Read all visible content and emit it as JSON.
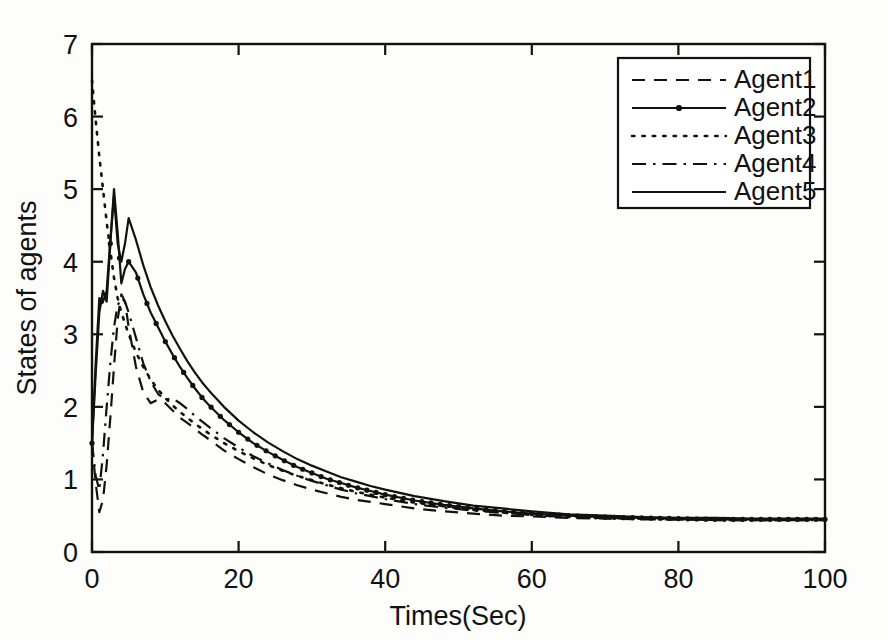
{
  "figure": {
    "background_color": "#fdfdfb",
    "ink_color": "#111111"
  },
  "chart_data": {
    "type": "line",
    "title": "",
    "xlabel": "Times(Sec)",
    "ylabel": "States of agents",
    "xlim": [
      0,
      100
    ],
    "ylim": [
      0,
      7
    ],
    "xticks": [
      0,
      20,
      40,
      60,
      80,
      100
    ],
    "yticks": [
      0,
      1,
      2,
      3,
      4,
      5,
      6,
      7
    ],
    "xtick_labels": [
      "0",
      "20",
      "40",
      "60",
      "80",
      "100"
    ],
    "ytick_labels": [
      "0",
      "1",
      "2",
      "3",
      "4",
      "5",
      "6",
      "7"
    ],
    "grid": false,
    "legend_position": "upper right",
    "legend_entries": [
      "Agent1",
      "Agent2",
      "Agent3",
      "Agent4",
      "Agent5"
    ],
    "x": [
      0,
      0.5,
      1,
      1.5,
      2,
      2.5,
      3,
      3.5,
      4,
      4.5,
      5,
      6,
      7,
      8,
      9,
      10,
      11,
      12,
      13,
      14,
      15,
      16,
      18,
      20,
      22,
      24,
      26,
      28,
      30,
      32,
      34,
      36,
      38,
      40,
      44,
      48,
      52,
      56,
      60,
      65,
      70,
      75,
      80,
      85,
      90,
      95,
      100
    ],
    "series": [
      {
        "name": "Agent1",
        "style": "dashed",
        "marker": "none",
        "color": "#111111",
        "values": [
          1.5,
          0.95,
          0.55,
          0.72,
          1.2,
          1.85,
          2.55,
          3.2,
          3.55,
          3.45,
          3.1,
          2.55,
          2.2,
          2.05,
          2.1,
          2.05,
          1.95,
          1.85,
          1.78,
          1.7,
          1.62,
          1.55,
          1.4,
          1.28,
          1.17,
          1.07,
          0.99,
          0.92,
          0.86,
          0.81,
          0.76,
          0.72,
          0.69,
          0.66,
          0.6,
          0.56,
          0.53,
          0.5,
          0.49,
          0.47,
          0.46,
          0.45,
          0.45,
          0.44,
          0.44,
          0.44,
          0.44
        ]
      },
      {
        "name": "Agent2",
        "style": "solid",
        "marker": "dot",
        "color": "#111111",
        "values": [
          1.5,
          2.45,
          3.3,
          3.6,
          3.45,
          4.25,
          5.0,
          4.4,
          3.7,
          3.9,
          4.0,
          3.85,
          3.55,
          3.3,
          3.1,
          2.9,
          2.72,
          2.55,
          2.4,
          2.26,
          2.13,
          2.02,
          1.82,
          1.65,
          1.5,
          1.38,
          1.27,
          1.17,
          1.09,
          1.01,
          0.95,
          0.89,
          0.84,
          0.79,
          0.71,
          0.65,
          0.6,
          0.56,
          0.53,
          0.5,
          0.48,
          0.47,
          0.46,
          0.45,
          0.45,
          0.45,
          0.45
        ]
      },
      {
        "name": "Agent3",
        "style": "dotted",
        "marker": "none",
        "color": "#111111",
        "values": [
          6.5,
          5.95,
          5.45,
          5.0,
          4.55,
          4.15,
          3.78,
          3.5,
          3.3,
          3.15,
          3.0,
          2.75,
          2.55,
          2.38,
          2.24,
          2.12,
          2.02,
          1.93,
          1.85,
          1.77,
          1.7,
          1.63,
          1.5,
          1.39,
          1.29,
          1.2,
          1.12,
          1.05,
          0.99,
          0.93,
          0.88,
          0.83,
          0.79,
          0.75,
          0.68,
          0.63,
          0.58,
          0.55,
          0.52,
          0.49,
          0.47,
          0.46,
          0.45,
          0.45,
          0.44,
          0.44,
          0.44
        ]
      },
      {
        "name": "Agent4",
        "style": "dashdot",
        "marker": "none",
        "color": "#111111",
        "values": [
          1.5,
          1.05,
          0.85,
          1.35,
          2.0,
          2.6,
          3.1,
          3.4,
          3.5,
          3.45,
          3.3,
          2.95,
          2.6,
          2.35,
          2.18,
          2.1,
          2.12,
          2.05,
          1.97,
          1.88,
          1.8,
          1.72,
          1.57,
          1.44,
          1.32,
          1.22,
          1.13,
          1.05,
          0.98,
          0.92,
          0.86,
          0.81,
          0.77,
          0.73,
          0.66,
          0.61,
          0.57,
          0.54,
          0.51,
          0.48,
          0.47,
          0.46,
          0.45,
          0.44,
          0.44,
          0.44,
          0.44
        ]
      },
      {
        "name": "Agent5",
        "style": "solid",
        "marker": "none",
        "color": "#111111",
        "values": [
          1.5,
          2.6,
          3.5,
          3.45,
          3.6,
          4.3,
          4.9,
          4.25,
          4.0,
          4.25,
          4.6,
          4.3,
          3.95,
          3.65,
          3.4,
          3.18,
          2.98,
          2.8,
          2.63,
          2.48,
          2.34,
          2.22,
          2.0,
          1.81,
          1.65,
          1.51,
          1.39,
          1.28,
          1.19,
          1.11,
          1.03,
          0.97,
          0.91,
          0.86,
          0.77,
          0.7,
          0.64,
          0.6,
          0.56,
          0.52,
          0.5,
          0.48,
          0.47,
          0.47,
          0.46,
          0.46,
          0.46
        ]
      }
    ]
  }
}
